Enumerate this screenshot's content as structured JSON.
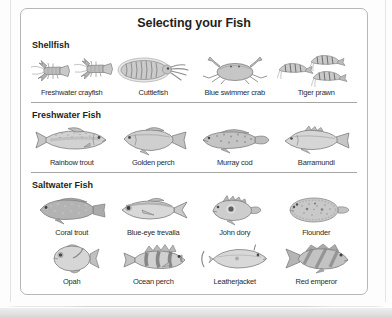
{
  "page": {
    "panel": {
      "title": "Selecting your Fish",
      "sections": [
        {
          "heading": "Shellfish",
          "items": [
            {
              "label": "Freshwater crayfish",
              "icon": "crayfish-illustration"
            },
            {
              "label": "Cuttlefish",
              "icon": "cuttlefish-illustration"
            },
            {
              "label": "Blue swimmer crab",
              "icon": "crab-illustration"
            },
            {
              "label": "Tiger prawn",
              "icon": "prawn-illustration"
            }
          ]
        },
        {
          "heading": "Freshwater Fish",
          "items": [
            {
              "label": "Rainbow trout",
              "icon": "rainbow-trout-illustration"
            },
            {
              "label": "Golden perch",
              "icon": "golden-perch-illustration"
            },
            {
              "label": "Murray cod",
              "icon": "murray-cod-illustration"
            },
            {
              "label": "Barramundi",
              "icon": "barramundi-illustration"
            }
          ]
        },
        {
          "heading": "Saltwater Fish",
          "items": [
            {
              "label": "Coral trout",
              "icon": "coral-trout-illustration"
            },
            {
              "label": "Blue-eye trevalla",
              "icon": "blue-eye-trevalla-illustration"
            },
            {
              "label": "John dory",
              "icon": "john-dory-illustration"
            },
            {
              "label": "Flounder",
              "icon": "flounder-illustration"
            },
            {
              "label": "Opah",
              "icon": "opah-illustration"
            },
            {
              "label": "Ocean perch",
              "icon": "ocean-perch-illustration"
            },
            {
              "label": "Leatherjacket",
              "icon": "leatherjacket-illustration"
            },
            {
              "label": "Red emperor",
              "icon": "red-emperor-illustration"
            }
          ]
        }
      ]
    },
    "colors": {
      "panel_border": "#b7b7b7",
      "divider": "#a5a5a5",
      "text": "#231f20",
      "illustration_gray": "#c6c6c6",
      "illustration_stroke": "#7e7e7e",
      "page_edge": "#d6d6d6"
    }
  }
}
